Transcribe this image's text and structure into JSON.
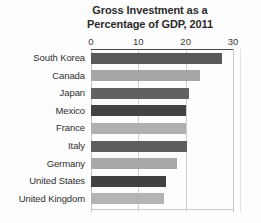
{
  "chart_data": {
    "type": "bar",
    "orientation": "horizontal",
    "title": "Gross Investment as a Percentage of GDP, 2011",
    "title_lines": [
      "Gross Investment as a",
      "Percentage of GDP, 2011"
    ],
    "xlabel": "",
    "ylabel": "",
    "xlim": [
      0,
      30
    ],
    "xticks": [
      0,
      10,
      20,
      30
    ],
    "xtick_labels": [
      "0",
      "10",
      "20",
      "30"
    ],
    "grid": true,
    "legend": "none",
    "categories": [
      "South Korea",
      "Canada",
      "Japan",
      "Mexico",
      "France",
      "Italy",
      "Germany",
      "United States",
      "United Kingdom"
    ],
    "values": [
      27.7,
      23.0,
      20.7,
      20.1,
      20.1,
      20.3,
      18.2,
      15.8,
      15.4
    ],
    "bar_colors": [
      "#595959",
      "#a6a6a6",
      "#616161",
      "#434343",
      "#b0b0b0",
      "#5e5e5e",
      "#a8a8a8",
      "#414141",
      "#b4b4b4"
    ]
  },
  "colors": {
    "background": "#fdfdfd",
    "axis": "#4a4a4a",
    "gridline": "#cfcfcf",
    "title_text": "#2b2b2b",
    "label_text": "#2f2f2f"
  }
}
